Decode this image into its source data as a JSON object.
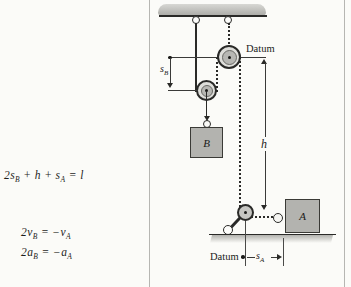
{
  "page": {
    "background": "#fbfbf8"
  },
  "equations": {
    "position": {
      "t1": "2s",
      "s1": "B",
      "t2": " + h + s",
      "s2": "A",
      "t3": " = l"
    },
    "velocity": {
      "t1": "2v",
      "s1": "B",
      "t2": " = −v",
      "s2": "A"
    },
    "acceleration": {
      "t1": "2a",
      "s1": "B",
      "t2": " = −a",
      "s2": "A"
    }
  },
  "figure": {
    "datum_top_label": "Datum",
    "datum_bottom_label": "Datum",
    "dim_sb": {
      "base": "s",
      "sub": "B"
    },
    "dim_sa": {
      "base": "s",
      "sub": "A"
    },
    "dim_h": "h",
    "block_b_label": "B",
    "block_a_label": "A",
    "icons": {
      "ceiling": "ceiling-hatch",
      "ground": "ground-hatch",
      "pulleys": "pulley-icon",
      "rings": "ring-hook-icon"
    },
    "colors": {
      "line": "#2a2a28",
      "metal_fill": "#b5b5b1",
      "pulley_ring": "#dededa",
      "block_fill": "#b3b3af",
      "frame_border": "#b6b6b2",
      "text": "#1c1c1a"
    }
  }
}
